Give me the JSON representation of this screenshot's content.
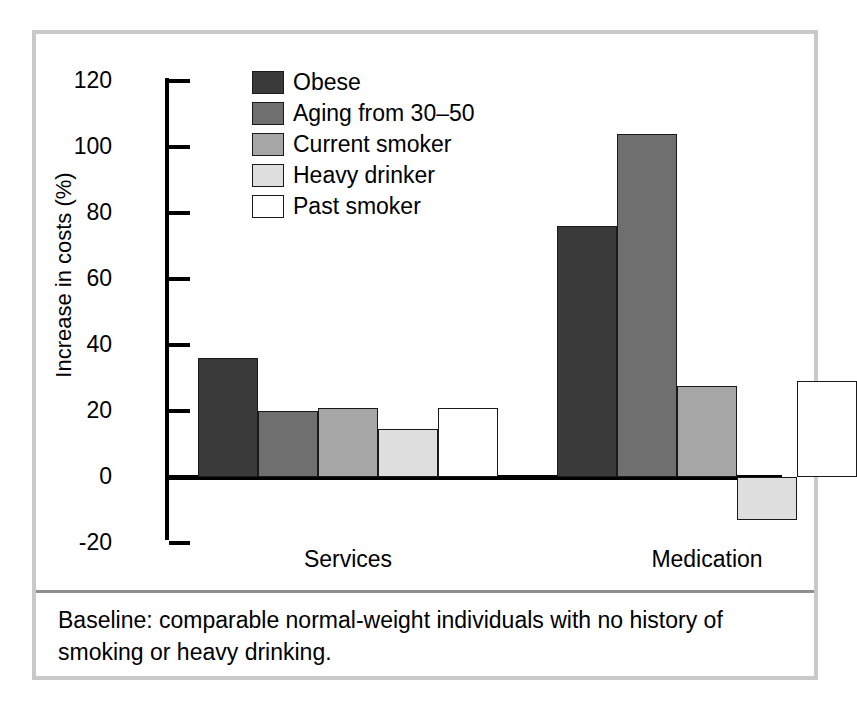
{
  "figure": {
    "caption": "Baseline: comparable normal-weight individuals with no history of smoking or heavy drinking."
  },
  "chart_data": {
    "type": "bar",
    "title": "",
    "xlabel": "",
    "ylabel": "Increase in costs (%)",
    "categories": [
      "Services",
      "Medication"
    ],
    "ylim": [
      -20,
      120
    ],
    "yticks": [
      -20,
      0,
      20,
      40,
      60,
      80,
      100,
      120
    ],
    "ytick_labels": [
      "-20",
      "0",
      "20",
      "40",
      "60",
      "80",
      "100",
      "120"
    ],
    "grid": false,
    "legend_position": "top-center",
    "series": [
      {
        "name": "Obese",
        "color": "#3a3a3a",
        "values": [
          36,
          76
        ]
      },
      {
        "name": "Aging from 30–50",
        "color": "#6f6f6f",
        "values": [
          20,
          104
        ]
      },
      {
        "name": "Current smoker",
        "color": "#a6a6a6",
        "values": [
          21,
          27.5
        ]
      },
      {
        "name": "Heavy drinker",
        "color": "#dedede",
        "values": [
          14.5,
          -13
        ]
      },
      {
        "name": "Past smoker",
        "color": "#ffffff",
        "values": [
          21,
          29
        ]
      }
    ]
  },
  "colors": {
    "frame": "#c9c9c9",
    "axis": "#000000",
    "bar_outline": "#1a1a1a"
  }
}
